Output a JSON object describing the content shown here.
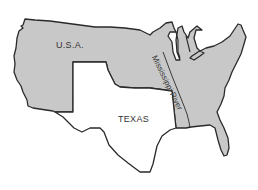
{
  "map": {
    "labels": {
      "usa": "U.S.A.",
      "texas": "TEXAS",
      "river": "Mississippi River"
    },
    "colors": {
      "usa_fill": "#c8c8c8",
      "texas_fill": "#ffffff",
      "outline": "#2a2a2a",
      "background": "#ffffff"
    },
    "regions": [
      "U.S.A.",
      "Texas"
    ],
    "features": [
      "Mississippi River",
      "Great Lakes",
      "Florida peninsula"
    ]
  }
}
